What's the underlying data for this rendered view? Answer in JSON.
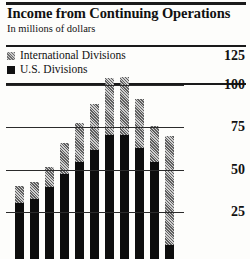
{
  "header": {
    "title": "Income from Continuing Operations",
    "subtitle": "In millions of dollars"
  },
  "legend": {
    "items": [
      {
        "label": "International Divisions",
        "swatch": "hatched-gray",
        "color": "#8a8a8a"
      },
      {
        "label": "U.S. Divisions",
        "swatch": "solid-black",
        "color": "#111111"
      }
    ]
  },
  "chart_data": {
    "type": "bar",
    "subtype": "stacked",
    "title": "Income from Continuing Operations",
    "subtitle": "In millions of dollars",
    "xlabel": "",
    "ylabel": "In millions of dollars",
    "ylim": [
      0,
      125
    ],
    "grid": true,
    "legend_position": "top-left",
    "ticks": [
      "125",
      "100",
      "75",
      "50",
      "25"
    ],
    "tick_values": [
      125,
      100,
      75,
      50,
      25
    ],
    "categories": [
      "1",
      "2",
      "3",
      "4",
      "5",
      "6",
      "7",
      "8",
      "9",
      "10",
      "11"
    ],
    "series": [
      {
        "name": "U.S. Divisions",
        "color": "#111111",
        "values": [
          33,
          35,
          42,
          50,
          57,
          64,
          73,
          73,
          65,
          57,
          8
        ]
      },
      {
        "name": "International Divisions",
        "color": "#8a8a8a",
        "values": [
          10,
          10,
          12,
          18,
          23,
          27,
          33,
          34,
          29,
          21,
          64
        ]
      }
    ],
    "totals": [
      43,
      45,
      54,
      68,
      80,
      91,
      106,
      107,
      94,
      78,
      72
    ]
  }
}
